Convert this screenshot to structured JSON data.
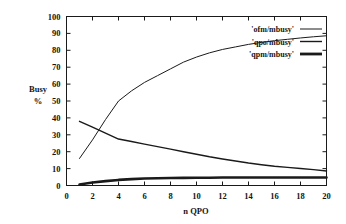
{
  "chart_data": {
    "type": "line",
    "title": "",
    "xlabel": "n QPO",
    "ylabel": "Busy\n%",
    "ylabel_line1": "Busy",
    "ylabel_line2": "%",
    "xlim": [
      0,
      20
    ],
    "ylim": [
      0,
      100
    ],
    "xticks": [
      0,
      2,
      4,
      6,
      8,
      10,
      12,
      14,
      16,
      18,
      20
    ],
    "yticks": [
      0,
      10,
      20,
      30,
      40,
      50,
      60,
      70,
      80,
      90,
      100
    ],
    "xtick_labels": [
      "0",
      "2",
      "4",
      "6",
      "8",
      "10",
      "12",
      "14",
      "16",
      "18",
      "20"
    ],
    "ytick_labels": [
      "0",
      "10",
      "20",
      "30",
      "40",
      "50",
      "60",
      "70",
      "80",
      "90",
      "100"
    ],
    "grid": false,
    "legend_position": "top-right-inside",
    "x": [
      1,
      2,
      3,
      4,
      5,
      6,
      7,
      8,
      9,
      10,
      11,
      12,
      13,
      14,
      15,
      16,
      17,
      18,
      19,
      20
    ],
    "series": [
      {
        "name": "'ofm/mbusy'",
        "line_width": 1,
        "color": "#1a1a1a",
        "values": [
          16,
          27,
          39,
          50,
          56,
          61,
          65,
          69,
          73,
          76,
          78.5,
          80.5,
          82,
          83.5,
          84.7,
          85.7,
          86.5,
          87.3,
          88,
          88.6
        ]
      },
      {
        "name": "'qpo/mbusy'",
        "line_width": 1.4,
        "color": "#1a1a1a",
        "values": [
          38,
          34.5,
          31,
          27.5,
          26,
          24.5,
          23,
          21.5,
          20,
          18.5,
          17,
          15.7,
          14.5,
          13.3,
          12.3,
          11.4,
          10.7,
          10.1,
          9.4,
          8.6
        ]
      },
      {
        "name": "'qpm/mbusy'",
        "line_width": 2.6,
        "color": "#1a1a1a",
        "values": [
          0.6,
          1.8,
          2.6,
          3.3,
          3.8,
          4.1,
          4.3,
          4.4,
          4.5,
          4.6,
          4.6,
          4.7,
          4.7,
          4.7,
          4.7,
          4.7,
          4.7,
          4.7,
          4.7,
          4.7
        ]
      }
    ]
  },
  "legend": {
    "entries": [
      {
        "label": "'ofm/mbusy'",
        "line_width": 1
      },
      {
        "label": "'qpo/mbusy'",
        "line_width": 1.4
      },
      {
        "label": "'qpm/mbusy'",
        "line_width": 2.8
      }
    ]
  }
}
